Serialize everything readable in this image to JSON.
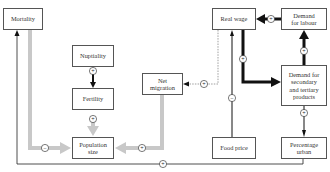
{
  "diagram": {
    "title": "",
    "colors": {
      "grey_arrow": "#c8c8c8",
      "black_arrow": "#111111",
      "box_border": "#555555",
      "text": "#333333"
    },
    "nodes": {
      "mortality": {
        "label": "Mortality"
      },
      "nuptiality": {
        "label": "Nuptiality"
      },
      "fertility": {
        "label": "Fertility"
      },
      "population_size": {
        "label": "Population\nsize"
      },
      "net_migration": {
        "label": "Net\nmigration"
      },
      "real_wage": {
        "label": "Real wage"
      },
      "demand_labour": {
        "label": "Demand\nfor labour"
      },
      "demand_products": {
        "label": "Demand for\nsecondary\nand tertiary\nproducts"
      },
      "food_price": {
        "label": "Food price"
      },
      "percentage_urban": {
        "label": "Percentage\nurban"
      }
    },
    "edges": [
      {
        "from": "mortality",
        "to": "population_size",
        "sign": "−",
        "style": "grey-thick"
      },
      {
        "from": "nuptiality",
        "to": "fertility",
        "sign": "+",
        "style": "black"
      },
      {
        "from": "fertility",
        "to": "population_size",
        "sign": "+",
        "style": "grey-thick"
      },
      {
        "from": "net_migration",
        "to": "population_size",
        "sign": "+",
        "style": "grey-thick"
      },
      {
        "from": "real_wage",
        "to": "net_migration",
        "sign": "+",
        "style": "dashed"
      },
      {
        "from": "demand_labour",
        "to": "real_wage",
        "sign": "+",
        "style": "black-thick"
      },
      {
        "from": "real_wage",
        "to": "demand_products",
        "sign": "+",
        "style": "black-thick"
      },
      {
        "from": "demand_products",
        "to": "demand_labour",
        "sign": "+",
        "style": "black-thick"
      },
      {
        "from": "food_price",
        "to": "real_wage",
        "sign": "−",
        "style": "black"
      },
      {
        "from": "demand_products",
        "to": "percentage_urban",
        "sign": "+",
        "style": "black"
      },
      {
        "from": "percentage_urban",
        "to": "mortality",
        "sign": "+",
        "style": "black"
      }
    ]
  }
}
